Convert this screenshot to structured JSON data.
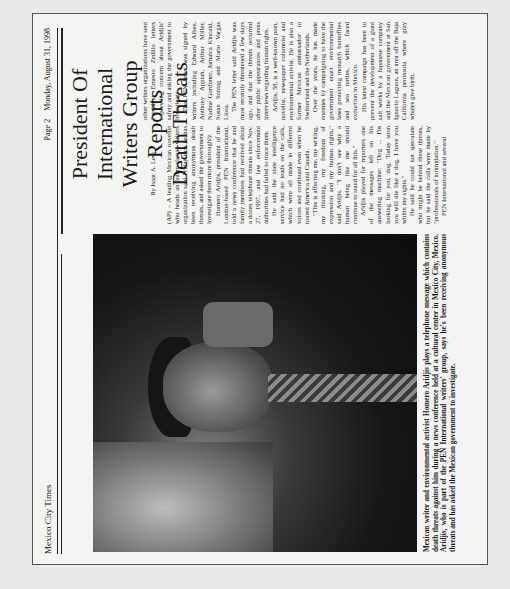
{
  "masthead": {
    "publication": "Mexico City Times",
    "page": "Page 2",
    "date": "Monday, August 31, 1998"
  },
  "headline": {
    "lines": [
      "President Of International",
      "Writers Group Reports",
      "Death Threats"
    ]
  },
  "byline": "By Isaac A. Levi",
  "photo": {
    "alt": "Man holding a telephone receiver to his ear, wearing a patterned tie"
  },
  "caption": "Mexican writer and environmental activist Homero Aridjis plays a telephone message which contains death threats against him during a news conference held at a cultural center in Mexico City, Mexico. Aridjis, who is part of the PEN International writers' group, says he's been receiving anonymous threats and has asked the Mexican government to investigate.",
  "article": {
    "column1": [
      "(AP) – A leading Mexican novelist who heads an international writers organization said Friday that he has been receiving anonymous death threats, and asked the government to investigate them more thoroughly.",
      "Homero Aridjis, president of the London-based PEN International, told a news conference that he and family members had received about a dozen telephone threats since Nov. 27, 1997, and law enforcement authorities had failed to trace them.",
      "He said the state intelligence service had no leads on the calls, which were all made in different voices and continued even when he toured America and Canada.",
      "\"This is affecting me, my writing, my thinking, my freedom of expression and my human rights,\" said Aridjis. \"I don't see why a human being like me should continue to stand for all this.\"",
      "Aridjis played for reporters one of the messages left on his answering machine: \"Dog ... I'm looking for you, dog. Today soon you will die like a dog. I have you within my sights.\"",
      "He said he could not speculate who might be behind these threats, but he said the calls were made by \"professionals of intimidation.\"",
      "PEN International and several"
    ],
    "column2": [
      "other writers organizations have sent President Ernesto Zedillo letters expressing concern about Aridjis' safety and asking the government to investigate.",
      "The PEN letter was signed by writers including Edward Albee, Anthony Appiah, Arthur Miller, Nadine Gordimer, Jamaica Kincaid, Susan Sontag and Mario Vargas Llosa.",
      "The PEN letter said Aridjis was most recently threatened a few days ago, and that the threats occurred after public appearances and press interviews regarding human rights.",
      "Aridjis, 58, is a well-known poet, novelist, newspaper columnist and environmental activist. He is also a former Mexican ambassador to Switzerland and the Netherlands.",
      "Over the years, he has made enemies by campaigning to have the government enact environmental laws protecting monarch butterflies and sea turtles, which faced extinction in Mexico.",
      "His latest campaign has been to prevent the development of a giant salt works by a Japanese company and the Mexican government at San Ignacio Lagoon, an area off the Baja California peninsula where gray whales give birth."
    ]
  }
}
